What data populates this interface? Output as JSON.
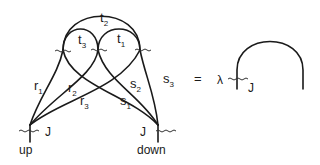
{
  "diagram": {
    "left": {
      "nodes": {
        "up": {
          "label": "up",
          "current_label": "J"
        },
        "down": {
          "label": "down",
          "current_label": "J"
        }
      },
      "edges": {
        "t1": {
          "base": "t",
          "sub": "1"
        },
        "t2": {
          "base": "t",
          "sub": "2"
        },
        "t3": {
          "base": "t",
          "sub": "3"
        },
        "r1": {
          "base": "r",
          "sub": "1"
        },
        "r2": {
          "base": "r",
          "sub": "2"
        },
        "r3": {
          "base": "r",
          "sub": "3"
        },
        "s1": {
          "base": "s",
          "sub": "1"
        },
        "s2": {
          "base": "s",
          "sub": "2"
        },
        "s3": {
          "base": "s",
          "sub": "3"
        }
      }
    },
    "equals": "=",
    "right": {
      "coefficient": "λ",
      "current_label": "J"
    }
  }
}
